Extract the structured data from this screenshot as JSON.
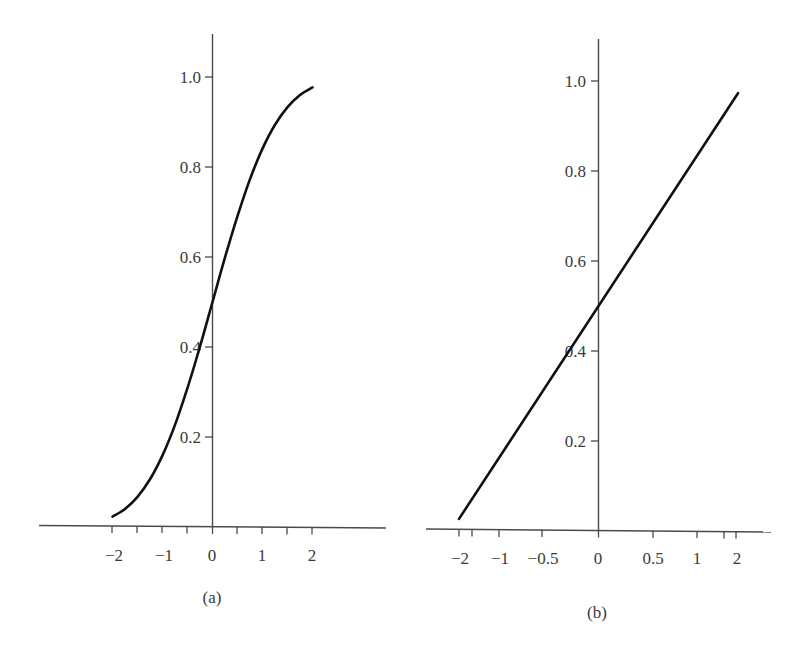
{
  "chart_data": [
    {
      "panel": "a",
      "type": "line",
      "title": "",
      "caption": "(a)",
      "xlabel": "",
      "ylabel": "",
      "xlim": [
        -2,
        2
      ],
      "ylim": [
        0,
        1.1
      ],
      "grid": false,
      "legend": null,
      "x_ticks": [
        "-2",
        "-1",
        "0",
        "1",
        "2"
      ],
      "x_minor_ticks": [
        -1.5,
        -0.5,
        0.5,
        1.5
      ],
      "y_ticks": [
        "0.2",
        "0.4",
        "0.6",
        "0.8",
        "1.0"
      ],
      "series": [
        {
          "name": "S-shaped cumulative curve",
          "x": [
            -2.0,
            -1.75,
            -1.5,
            -1.25,
            -1.0,
            -0.75,
            -0.5,
            -0.25,
            0.0,
            0.25,
            0.5,
            0.75,
            1.0,
            1.25,
            1.5,
            1.75,
            2.0
          ],
          "y": [
            0.023,
            0.04,
            0.067,
            0.106,
            0.159,
            0.227,
            0.309,
            0.401,
            0.5,
            0.599,
            0.691,
            0.773,
            0.841,
            0.894,
            0.933,
            0.96,
            0.977
          ]
        }
      ]
    },
    {
      "panel": "b",
      "type": "line",
      "title": "",
      "caption": "(b)",
      "xlabel": "",
      "ylabel": "",
      "xlim": [
        -2,
        2
      ],
      "ylim": [
        0,
        1.1
      ],
      "x_scale": "nonlinear (probability-transformed, straightens the curve)",
      "grid": false,
      "legend": null,
      "x_ticks": [
        "-2",
        "-1",
        "-0.5",
        "0",
        "0.5",
        "1",
        "2"
      ],
      "y_ticks": [
        "0.2",
        "0.4",
        "0.6",
        "0.8",
        "1.0"
      ],
      "series": [
        {
          "name": "Straightened cumulative line",
          "x": [
            -2,
            -1,
            -0.5,
            0,
            0.5,
            1,
            2
          ],
          "y": [
            0.027,
            0.16,
            0.31,
            0.5,
            0.69,
            0.84,
            0.973
          ]
        }
      ]
    }
  ],
  "panel_a": {
    "caption": "(a)",
    "x_tick_labels": [
      "−2",
      "−1",
      "0",
      "1",
      "2"
    ],
    "y_tick_labels": [
      "1.0",
      "0.8",
      "0.6",
      "0.4",
      "0.2"
    ]
  },
  "panel_b": {
    "caption": "(b)",
    "x_tick_labels": [
      "−2",
      "−1",
      "−0.5",
      "0",
      "0.5",
      "1",
      "2"
    ],
    "y_tick_labels": [
      "1.0",
      "0.8",
      "0.6",
      "0.4",
      "0.2"
    ]
  },
  "colors": {
    "curve": "#111111",
    "axis": "#4a4a4a",
    "text": "#3a3a3a",
    "background": "#ffffff"
  }
}
